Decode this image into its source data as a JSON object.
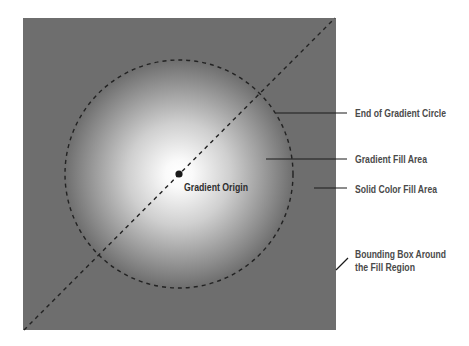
{
  "diagram": {
    "type": "radial-gradient-anatomy",
    "colors": {
      "solid_fill": "#6e6e6e",
      "gradient_center": "#ffffff",
      "gradient_edge": "#6e6e6e",
      "dash_stroke": "#222222",
      "leader_stroke": "#1a1a1a",
      "label_text": "#4a4a4a"
    },
    "bounding_box": {
      "x": 23,
      "y": 18,
      "width": 313,
      "height": 312
    },
    "gradient_circle": {
      "cx": 179,
      "cy": 174,
      "r": 114
    },
    "gradient_origin": {
      "cx": 179,
      "cy": 174
    },
    "diagonal_line": {
      "x1": 24,
      "y1": 330,
      "x2": 335,
      "y2": 18
    },
    "labels": {
      "origin": "Gradient Origin",
      "end_circle": "End of Gradient Circle",
      "gradient_fill": "Gradient Fill Area",
      "solid_fill": "Solid Color Fill Area",
      "bounding_box_line1": "Bounding Box Around",
      "bounding_box_line2": "the Fill Region"
    }
  }
}
